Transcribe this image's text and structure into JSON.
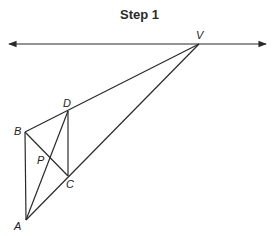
{
  "title": "Step 1",
  "points": {
    "V": {
      "label": "V",
      "x": 199,
      "y": 44
    },
    "D": {
      "label": "D",
      "x": 68,
      "y": 111
    },
    "B": {
      "label": "B",
      "x": 25,
      "y": 132
    },
    "P": {
      "label": "P",
      "x": 50,
      "y": 158
    },
    "C": {
      "label": "C",
      "x": 68,
      "y": 176
    },
    "A": {
      "label": "A",
      "x": 26,
      "y": 220
    }
  },
  "horizon_line": {
    "x1": 9,
    "x2": 266,
    "y": 44
  },
  "segments": [
    [
      "B",
      "V"
    ],
    [
      "A",
      "V"
    ],
    [
      "B",
      "A"
    ],
    [
      "D",
      "C"
    ],
    [
      "B",
      "C"
    ],
    [
      "A",
      "D"
    ]
  ],
  "colors": {
    "stroke": "#2a2a2a"
  }
}
